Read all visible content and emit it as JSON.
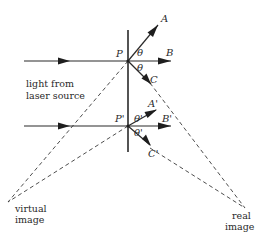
{
  "diagram": {
    "type": "optics-ray-diagram",
    "colors": {
      "ink": "#2a2a2a",
      "background": "#ffffff"
    },
    "labels": {
      "P": "P",
      "P_prime": "P'",
      "A": "A",
      "B": "B",
      "C": "C",
      "A_prime": "A'",
      "B_prime": "B'",
      "C_prime": "C'",
      "theta_upper": "θ",
      "theta_lower": "θ",
      "theta_prime_upper": "θ'",
      "theta_prime_lower": "θ'",
      "source_line1": "light from",
      "source_line2": "laser source",
      "virtual_line1": "virtual",
      "virtual_line2": "image",
      "real_line1": "real",
      "real_line2": "image"
    },
    "nodes": {
      "P": {
        "x": 128,
        "y": 61
      },
      "P_prime": {
        "x": 128,
        "y": 126
      },
      "virtual_image": {
        "x": 8,
        "y": 202
      },
      "real_image": {
        "x": 245,
        "y": 208
      }
    },
    "edges": [
      {
        "from": "laser",
        "to": "P",
        "style": "solid-arrow"
      },
      {
        "from": "laser",
        "to": "P_prime",
        "style": "solid-arrow"
      },
      {
        "from": "P",
        "to": "A",
        "style": "solid-arrow"
      },
      {
        "from": "P",
        "to": "B",
        "style": "solid-arrow"
      },
      {
        "from": "P",
        "to": "C",
        "style": "solid-arrow"
      },
      {
        "from": "P_prime",
        "to": "A_prime",
        "style": "solid-arrow"
      },
      {
        "from": "P_prime",
        "to": "B_prime",
        "style": "solid-arrow"
      },
      {
        "from": "P_prime",
        "to": "C_prime",
        "style": "solid-arrow"
      },
      {
        "from": "P",
        "to": "virtual_image",
        "style": "dashed"
      },
      {
        "from": "P_prime",
        "to": "virtual_image",
        "style": "dashed"
      },
      {
        "from": "C",
        "to": "real_image",
        "style": "dashed"
      },
      {
        "from": "C_prime",
        "to": "real_image",
        "style": "dashed"
      }
    ]
  }
}
